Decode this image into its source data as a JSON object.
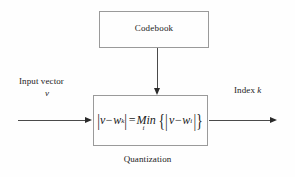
{
  "diagram": {
    "background_color": "#fefefe",
    "line_color": "#4a4a4a",
    "border_color": "#9a9a9a",
    "text_color": "#1a1a1a"
  },
  "codebook": {
    "label": "Codebook"
  },
  "quantization": {
    "caption": "Quantization",
    "formula_plain": "|v - w_k| = Min_i {|v - w_i|}",
    "formula_parts": {
      "open_bar": "|",
      "v": "v",
      "minus": "−",
      "w": "w",
      "sub_k": "k",
      "close_bar": "|",
      "equals": "=",
      "min": "Min",
      "sub_i_under": "i",
      "open_brace_bar": "{|",
      "v2": "v",
      "minus2": "−",
      "w2": "w",
      "sub_i": "i",
      "close_brace_bar": "|}"
    }
  },
  "input": {
    "label": "Input vector",
    "symbol": "v"
  },
  "output": {
    "label": "Index ",
    "symbol": "k"
  },
  "arrows": {
    "input_arrow": "arrow-right",
    "output_arrow": "arrow-right",
    "codebook_arrow": "arrow-down"
  }
}
